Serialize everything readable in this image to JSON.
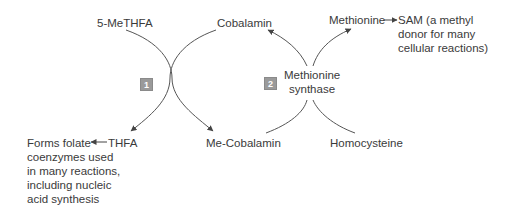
{
  "diagram": {
    "type": "metabolic-pathway",
    "colors": {
      "text": "#3a3a3a",
      "line": "#444444",
      "badge_bg": "#9a9a9a",
      "badge_text": "#ffffff"
    },
    "reaction1": {
      "badge": "1",
      "substrate_top_left": "5-MeTHFA",
      "substrate_top_right": "Cobalamin",
      "product_bottom_left": "THFA",
      "product_bottom_right": "Me-Cobalamin"
    },
    "reaction2": {
      "badge": "2",
      "enzyme_line1": "Methionine",
      "enzyme_line2": "synthase",
      "substrate_bottom_left": "Me-Cobalamin",
      "substrate_bottom_right": "Homocysteine",
      "product_top_left": "Cobalamin",
      "product_top_right": "Methionine"
    },
    "sam_note": {
      "arrow": "→",
      "line1": "SAM (a methyl",
      "line2": "donor for many",
      "line3": "cellular reactions)"
    },
    "thfa_note": {
      "arrow": "←",
      "line1": "Forms folate",
      "line2": "coenzymes used",
      "line3": "in many reactions,",
      "line4": "including nucleic",
      "line5": "acid synthesis"
    }
  }
}
